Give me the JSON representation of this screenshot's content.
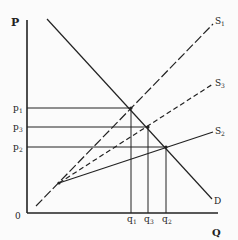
{
  "diagram": {
    "type": "supply-demand",
    "axes": {
      "y_label": "P",
      "x_label": "Q",
      "origin_label": "0"
    },
    "curves": {
      "demand": {
        "label": "D",
        "style": "solid"
      },
      "supply1": {
        "label": "S",
        "sub": "1",
        "style": "long-dash"
      },
      "supply3": {
        "label": "S",
        "sub": "3",
        "style": "short-dash"
      },
      "supply2": {
        "label": "S",
        "sub": "2",
        "style": "solid"
      }
    },
    "prices": [
      {
        "label": "p",
        "sub": "1"
      },
      {
        "label": "p",
        "sub": "3"
      },
      {
        "label": "p",
        "sub": "2"
      }
    ],
    "quantities": [
      {
        "label": "q",
        "sub": "1"
      },
      {
        "label": "q",
        "sub": "3"
      },
      {
        "label": "q",
        "sub": "2"
      }
    ],
    "colors": {
      "line": "#222222",
      "background": "#fbfbfb"
    }
  }
}
